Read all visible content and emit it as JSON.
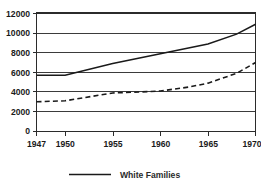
{
  "chart_data": {
    "type": "line",
    "title": "",
    "subtitle": "",
    "xlabel": "",
    "ylabel": "",
    "x": [
      1947,
      1950,
      1955,
      1960,
      1965,
      1970
    ],
    "xlim": [
      1947,
      1970
    ],
    "ylim": [
      0,
      12000
    ],
    "grid": true,
    "grid_axis": "y",
    "legend_position": "bottom",
    "x_tick_labels": [
      "1947",
      "1950",
      "1955",
      "1960",
      "1965",
      "1970"
    ],
    "y_tick_labels": [
      "0",
      "2000",
      "4000",
      "6000",
      "8000",
      "10000",
      "12000"
    ],
    "y_ticks": [
      0,
      2000,
      4000,
      6000,
      8000,
      10000,
      12000
    ],
    "series": [
      {
        "name": "White Families",
        "style": "solid",
        "color": "#1a1a1a",
        "x": [
          1947,
          1950,
          1955,
          1960,
          1965,
          1968,
          1970
        ],
        "values": [
          5700,
          5700,
          6900,
          7900,
          8900,
          9900,
          10900
        ]
      },
      {
        "name": "",
        "style": "dashed",
        "color": "#1a1a1a",
        "x": [
          1947,
          1950,
          1955,
          1958,
          1960,
          1963,
          1965,
          1968,
          1970
        ],
        "values": [
          3000,
          3100,
          3900,
          4000,
          4100,
          4500,
          4900,
          5900,
          7000
        ]
      }
    ],
    "annotations": []
  },
  "legend": {
    "entries": [
      {
        "label": "White Families",
        "style": "solid",
        "color": "#1a1a1a"
      }
    ]
  }
}
